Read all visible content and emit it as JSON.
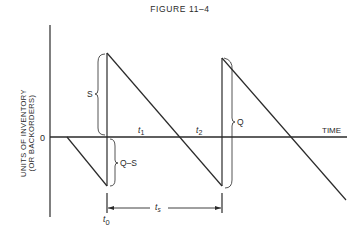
{
  "figure": {
    "title": "FIGURE 11–4",
    "y_axis_label_line1": "UNITS OF INVENTORY",
    "y_axis_label_line2": "(OR BACKORDERS)",
    "x_axis_label": "TIME",
    "zero_label": "0",
    "labels": {
      "S": "S",
      "Q_minus_S": "Q–S",
      "Q": "Q",
      "t0": "t",
      "t0_sub": "0",
      "t1": "t",
      "t1_sub": "1",
      "t2": "t",
      "t2_sub": "2",
      "ts": "t",
      "ts_sub": "s"
    },
    "colors": {
      "line": "#2a2a2a",
      "background": "#ffffff"
    }
  }
}
